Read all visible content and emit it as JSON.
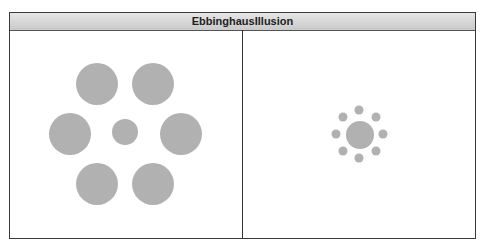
{
  "title": "EbbinghausIllusion",
  "colors": {
    "circle": "#b1b1b1",
    "border": "#3a3a3a",
    "header_top": "#e6e6e6",
    "header_bottom": "#c9c9c9"
  },
  "panels": [
    {
      "name": "large-surround",
      "center_circle": {
        "cx": 125,
        "cy": 132,
        "r": 13
      },
      "surround_circles": [
        {
          "cx": 97,
          "cy": 84,
          "r": 21
        },
        {
          "cx": 153,
          "cy": 84,
          "r": 21
        },
        {
          "cx": 70,
          "cy": 134,
          "r": 21
        },
        {
          "cx": 181,
          "cy": 134,
          "r": 21
        },
        {
          "cx": 97,
          "cy": 184,
          "r": 21
        },
        {
          "cx": 153,
          "cy": 184,
          "r": 21
        }
      ]
    },
    {
      "name": "small-surround",
      "center_circle": {
        "cx": 360,
        "cy": 135,
        "r": 14
      },
      "surround_circles": [
        {
          "cx": 359,
          "cy": 110,
          "r": 4.5
        },
        {
          "cx": 376,
          "cy": 117,
          "r": 4.5
        },
        {
          "cx": 383,
          "cy": 134,
          "r": 4.5
        },
        {
          "cx": 376,
          "cy": 151,
          "r": 4.5
        },
        {
          "cx": 359,
          "cy": 158,
          "r": 4.5
        },
        {
          "cx": 343,
          "cy": 151,
          "r": 4.5
        },
        {
          "cx": 336,
          "cy": 134,
          "r": 4.5
        },
        {
          "cx": 343,
          "cy": 117,
          "r": 4.5
        }
      ]
    }
  ]
}
